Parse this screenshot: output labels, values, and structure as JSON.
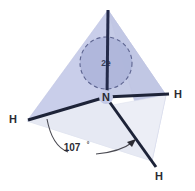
{
  "figure": {
    "background_color": "#ffffff"
  },
  "shape": {
    "name": "tetrahedron",
    "back_face_color": "#c8cde6",
    "right_face_color": "#c2c8e3",
    "front_face_color": "#e9ebf5",
    "edge_color": "#b9bfdc",
    "apex": {
      "x": 108,
      "y": 10
    },
    "left_vertex": {
      "x": 27,
      "y": 121
    },
    "right_vertex": {
      "x": 166,
      "y": 95
    },
    "front_vertex": {
      "x": 152,
      "y": 161
    }
  },
  "central_atom": {
    "symbol": "N",
    "x": 106,
    "y": 97,
    "color": "#2b2b33"
  },
  "lone_pair": {
    "label": "2e",
    "center_x": 106,
    "center_y": 63,
    "radius": 26,
    "fill_color": "#aeb5da",
    "dash_color": "#5d6490",
    "dash_pattern": "4 3"
  },
  "bonds": [
    {
      "name": "lone-pair-bond-up",
      "from_x": 106,
      "from_y": 97,
      "to_x": 108,
      "to_y": 10,
      "width": 3,
      "color": "#232a4a",
      "has_arrow": false
    },
    {
      "name": "bond-n-h-left",
      "from_x": 106,
      "from_y": 97,
      "to_x": 28,
      "to_y": 120,
      "width": 3,
      "color": "#1d2338",
      "has_arrow": false
    },
    {
      "name": "bond-n-h-right",
      "from_x": 106,
      "from_y": 97,
      "to_x": 168,
      "to_y": 94,
      "width": 3,
      "color": "#1d2338",
      "has_arrow": false
    },
    {
      "name": "bond-n-h-front",
      "from_x": 106,
      "from_y": 97,
      "to_x": 155,
      "to_y": 166,
      "width": 3,
      "color": "#1d2338",
      "has_arrow": false
    }
  ],
  "hydrogens": [
    {
      "symbol": "H",
      "position": "left",
      "x": 13,
      "y": 119
    },
    {
      "symbol": "H",
      "position": "right",
      "x": 178,
      "y": 94
    },
    {
      "symbol": "H",
      "position": "front",
      "x": 159,
      "y": 176
    }
  ],
  "angle": {
    "value": "107",
    "degree_symbol": "°",
    "full_label": "107°",
    "arc_color": "#4a4a52",
    "arc_width": 1.1,
    "label_x": 72,
    "label_y": 147,
    "arrow_x": 133,
    "arrow_y": 143
  }
}
